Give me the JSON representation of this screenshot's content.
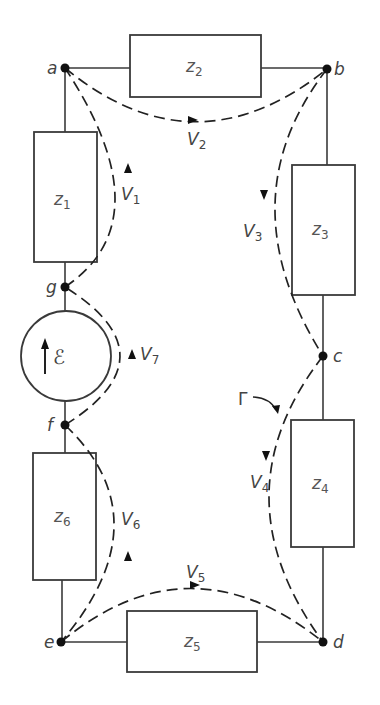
{
  "diagram": {
    "type": "circuit-loop",
    "nodes": [
      {
        "id": "a",
        "label": "a"
      },
      {
        "id": "b",
        "label": "b"
      },
      {
        "id": "c",
        "label": "c"
      },
      {
        "id": "d",
        "label": "d"
      },
      {
        "id": "e",
        "label": "e"
      },
      {
        "id": "f",
        "label": "f"
      },
      {
        "id": "g",
        "label": "g"
      }
    ],
    "impedances": [
      {
        "id": "z1",
        "base": "z",
        "sub": "1",
        "between": [
          "a",
          "g"
        ]
      },
      {
        "id": "z2",
        "base": "z",
        "sub": "2",
        "between": [
          "a",
          "b"
        ]
      },
      {
        "id": "z3",
        "base": "z",
        "sub": "3",
        "between": [
          "b",
          "c"
        ]
      },
      {
        "id": "z4",
        "base": "z",
        "sub": "4",
        "between": [
          "c",
          "d"
        ]
      },
      {
        "id": "z5",
        "base": "z",
        "sub": "5",
        "between": [
          "e",
          "d"
        ]
      },
      {
        "id": "z6",
        "base": "z",
        "sub": "6",
        "between": [
          "f",
          "e"
        ]
      }
    ],
    "source": {
      "id": "emf",
      "symbol": "ℰ",
      "between": [
        "f",
        "g"
      ],
      "direction": "up"
    },
    "voltages": [
      {
        "id": "V1",
        "base": "V",
        "sub": "1",
        "from": "g",
        "to": "a"
      },
      {
        "id": "V2",
        "base": "V",
        "sub": "2",
        "from": "a",
        "to": "b"
      },
      {
        "id": "V3",
        "base": "V",
        "sub": "3",
        "from": "b",
        "to": "c"
      },
      {
        "id": "V4",
        "base": "V",
        "sub": "4",
        "from": "c",
        "to": "d"
      },
      {
        "id": "V5",
        "base": "V",
        "sub": "5",
        "from": "e",
        "to": "d"
      },
      {
        "id": "V6",
        "base": "V",
        "sub": "6",
        "from": "e",
        "to": "f"
      },
      {
        "id": "V7",
        "base": "V",
        "sub": "7",
        "from": "f",
        "to": "g"
      }
    ],
    "loop_label": "Γ",
    "colors": {
      "line": "#3a3a3a",
      "node": "#111111",
      "text": "#444444",
      "background": "#ffffff"
    }
  }
}
